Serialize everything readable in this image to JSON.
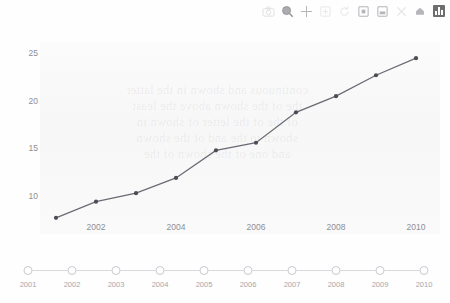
{
  "toolbar": {
    "items": [
      {
        "name": "camera-icon",
        "label": "Camera"
      },
      {
        "name": "zoom-search-icon",
        "label": "Zoom"
      },
      {
        "name": "move-crosshair-icon",
        "label": "Pan"
      },
      {
        "name": "zoom-in-box-icon",
        "label": "Zoom in"
      },
      {
        "name": "reset-rotate-icon",
        "label": "Reset"
      },
      {
        "name": "autoscale-icon",
        "label": "Autoscale"
      },
      {
        "name": "reset-axes-icon",
        "label": "Reset axes"
      },
      {
        "name": "close-icon",
        "label": "Close"
      },
      {
        "name": "home-icon",
        "label": "Home"
      },
      {
        "name": "chart-logo-icon",
        "label": "Chart"
      }
    ]
  },
  "chart_data": {
    "type": "line",
    "title": "",
    "xlabel": "",
    "ylabel": "",
    "x": [
      2001,
      2002,
      2003,
      2004,
      2005,
      2006,
      2007,
      2008,
      2009,
      2010
    ],
    "values": [
      7.7,
      9.4,
      10.3,
      11.9,
      14.8,
      15.6,
      18.8,
      20.5,
      22.7,
      24.5
    ],
    "series": [
      {
        "name": "value",
        "values": [
          7.7,
          9.4,
          10.3,
          11.9,
          14.8,
          15.6,
          18.8,
          20.5,
          22.7,
          24.5
        ]
      }
    ],
    "xlim": [
      2000.6,
      2010.6
    ],
    "ylim": [
      6.0,
      26.2
    ],
    "xticks": [
      2002,
      2004,
      2006,
      2008,
      2010
    ],
    "yticks": [
      10,
      15,
      20,
      25
    ],
    "grid": false,
    "legend": false,
    "line_color": "#6b6b74",
    "marker_color": "#4c4c55",
    "plot_bg": "#f8f8f8"
  },
  "timeline": {
    "years": [
      2001,
      2002,
      2003,
      2004,
      2005,
      2006,
      2007,
      2008,
      2009,
      2010
    ]
  },
  "ghost_text": "bleed-through text"
}
